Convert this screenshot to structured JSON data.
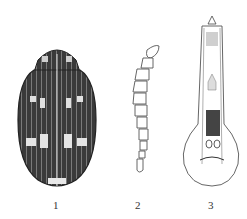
{
  "figure": {
    "panels": [
      {
        "id": "1",
        "label": "1",
        "subject": "beetle-dorsal-view"
      },
      {
        "id": "2",
        "label": "2",
        "subject": "antenna"
      },
      {
        "id": "3",
        "label": "3",
        "subject": "aedeagus"
      }
    ],
    "colors": {
      "background": "#ffffff",
      "ink": "#2a2a2a",
      "body_dark": "#3a3a3a",
      "pattern_light": "#d8d8d8"
    }
  }
}
